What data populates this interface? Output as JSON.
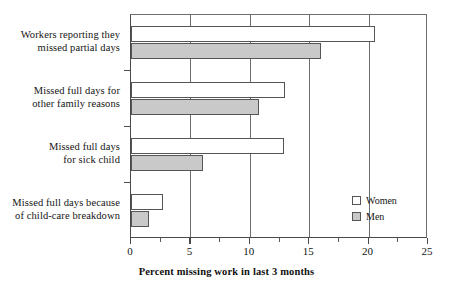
{
  "chart_data": {
    "type": "bar",
    "orientation": "horizontal",
    "title": "",
    "xlabel": "Percent missing work in last 3 months",
    "ylabel": "",
    "xlim": [
      0,
      25
    ],
    "xticks": [
      0,
      5,
      10,
      15,
      20,
      25
    ],
    "xticklabels": [
      "0",
      "5",
      "10",
      "15",
      "20",
      "25"
    ],
    "minor_xticks": [
      2.5,
      7.5,
      12.5,
      17.5,
      22.5
    ],
    "grid": "vertical-major",
    "legend_position": "inside-lower-right",
    "categories": [
      "Workers reporting they missed partial days",
      "Missed full days for other family reasons",
      "Missed full days for sick child",
      "Missed full days because of child-care breakdown"
    ],
    "category_lines": [
      [
        "Workers reporting they",
        "missed partial days"
      ],
      [
        "Missed full days for",
        "other family reasons"
      ],
      [
        "Missed full days",
        "for sick child"
      ],
      [
        "Missed full days because",
        "of child-care breakdown"
      ]
    ],
    "series": [
      {
        "name": "Women",
        "color": "#ffffff",
        "edge_color": "#555555",
        "values": [
          20.5,
          13.0,
          12.9,
          2.7
        ]
      },
      {
        "name": "Men",
        "color": "#c9c9c9",
        "edge_color": "#555555",
        "values": [
          16.0,
          10.8,
          6.1,
          1.5
        ]
      }
    ]
  },
  "axis": {
    "title": "Percent missing work in last 3 months",
    "tick_labels": [
      "0",
      "5",
      "10",
      "15",
      "20",
      "25"
    ]
  },
  "legend": {
    "items": [
      {
        "label": "Women",
        "swatch": "white-square"
      },
      {
        "label": "Men",
        "swatch": "gray-square"
      }
    ]
  },
  "colors": {
    "women_fill": "#ffffff",
    "men_fill": "#c9c9c9",
    "bar_edge": "#555555",
    "axis": "#4a4a4a",
    "gridline": "#6e6e6e",
    "text": "#141414",
    "background": "#ffffff"
  }
}
